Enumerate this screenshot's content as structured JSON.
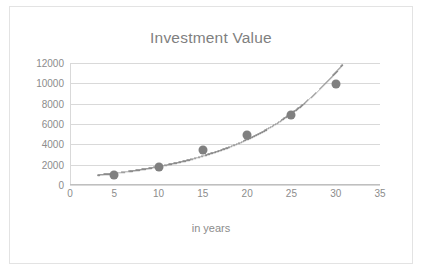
{
  "chart_data": {
    "type": "scatter",
    "title": "Investment Value",
    "xlabel": "in years",
    "ylabel": "",
    "x": [
      5,
      10,
      15,
      20,
      25,
      30
    ],
    "values": [
      1000,
      1800,
      3400,
      4900,
      6900,
      9900
    ],
    "series": [
      {
        "name": "Investment Value",
        "x": [
          5,
          10,
          15,
          20,
          25,
          30
        ],
        "values": [
          1000,
          1800,
          3400,
          4900,
          6900,
          9900
        ]
      }
    ],
    "trendline": {
      "type": "exponential",
      "style": "dotted",
      "color": "#8c8c8c"
    },
    "xlim": [
      0,
      35
    ],
    "ylim": [
      0,
      12000
    ],
    "xticks": [
      0,
      5,
      10,
      15,
      20,
      25,
      30,
      35
    ],
    "yticks": [
      0,
      2000,
      4000,
      6000,
      8000,
      10000,
      12000
    ],
    "xtick_labels": [
      "0",
      "5",
      "10",
      "15",
      "20",
      "25",
      "30",
      "35"
    ],
    "ytick_labels": [
      "0",
      "2000",
      "4000",
      "6000",
      "8000",
      "10000",
      "12000"
    ],
    "grid": "horizontal",
    "legend": "none",
    "marker_color": "#808080",
    "grid_color": "#d9d9d9",
    "text_color": "#8c8c8c"
  }
}
